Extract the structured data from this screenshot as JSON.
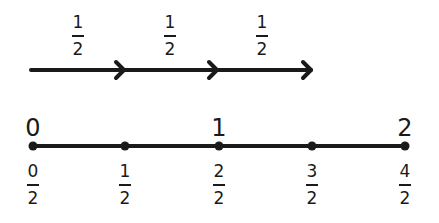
{
  "jumps": [
    {
      "num": "1",
      "den": "2"
    },
    {
      "num": "1",
      "den": "2"
    },
    {
      "num": "1",
      "den": "2"
    }
  ],
  "wholes": [
    "0",
    "1",
    "2"
  ],
  "ticks": [
    {
      "num": "0",
      "den": "2"
    },
    {
      "num": "1",
      "den": "2"
    },
    {
      "num": "2",
      "den": "2"
    },
    {
      "num": "3",
      "den": "2"
    },
    {
      "num": "4",
      "den": "2"
    }
  ],
  "colors": {
    "ink": "#1a1a1a",
    "background": "#ffffff"
  }
}
